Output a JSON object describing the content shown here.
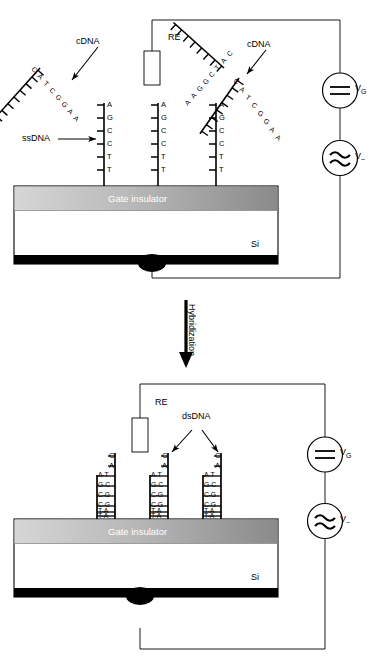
{
  "figure": {
    "panels": [
      {
        "id": "top-panel",
        "name": "before-hybridization",
        "description": "ssDNA probes immobilized on gate insulator with free cDNA targets in solution"
      },
      {
        "id": "bottom-panel",
        "name": "after-hybridization",
        "description": "dsDNA duplexes formed on gate insulator"
      }
    ],
    "process_arrow_label": "Hybridization"
  },
  "labels": {
    "reference_electrode": "RE",
    "cdna": "cDNA",
    "ssdna": "ssDNA",
    "dsdna": "dsDNA",
    "gate_insulator": "Gate insulator",
    "silicon": "Si",
    "vg": "V",
    "vg_sub": "G",
    "vac": "V",
    "vac_sub": "~"
  },
  "sequences": {
    "ssdna_probe": [
      "A",
      "G",
      "C",
      "C",
      "T",
      "T"
    ],
    "cdna_target": [
      "C",
      "A",
      "T",
      "C",
      "G",
      "G",
      "A",
      "A"
    ],
    "cdna_target_mirrored": [
      "A",
      "A",
      "G",
      "G",
      "C",
      "T",
      "A",
      "C"
    ],
    "dsdna_unpaired": [
      "C",
      "A"
    ],
    "dsdna_pairs": [
      "A-T",
      "G-C",
      "C-G",
      "C-G",
      "T-A",
      "T-A"
    ]
  },
  "colors": {
    "stroke": "#000000",
    "gate_insulator_light": "#d2d2d2",
    "gate_insulator_dark": "#8e8e8e",
    "substrate": "#ffffff",
    "contact": "#000000",
    "background": "#ffffff"
  },
  "circuit": {
    "dc_source_symbol": "dc-source-icon",
    "ac_source_symbol": "ac-source-icon",
    "re_symbol": "reference-electrode-icon"
  }
}
